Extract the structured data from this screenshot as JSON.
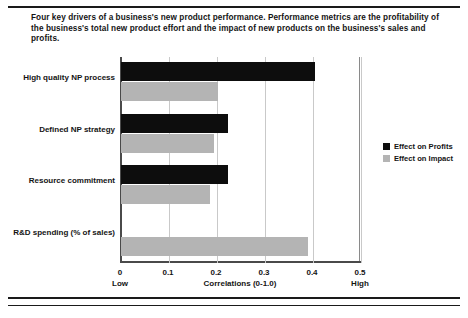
{
  "caption": "Four key drivers of a business's new product performance. Performance metrics are the profitability of the business's total new product effort and the impact of new products on the business's sales and profits.",
  "legend": {
    "position": "right",
    "items": [
      {
        "label": "Effect on Profits",
        "color": "#0d0d0d",
        "swatch_name": "legend-swatch-profits"
      },
      {
        "label": "Effect on Impact",
        "color": "#b4b4b4",
        "swatch_name": "legend-swatch-impact"
      }
    ]
  },
  "axis": {
    "title": "Correlations (0-1.0)",
    "ticks": [
      "0",
      "0.1",
      "0.2",
      "0.3",
      "0.4",
      "0.5"
    ],
    "tick_values": [
      0,
      0.1,
      0.2,
      0.3,
      0.4,
      0.5
    ],
    "low_label": "Low",
    "high_label": "High"
  },
  "chart_data": {
    "type": "bar",
    "orientation": "horizontal",
    "title": "",
    "xlabel": "Correlations (0-1.0)",
    "ylabel": "",
    "xlim": [
      0,
      0.5
    ],
    "xticks": [
      0,
      0.1,
      0.2,
      0.3,
      0.4,
      0.5
    ],
    "grid": true,
    "legend_position": "right",
    "categories": [
      "High quality NP process",
      "Defined NP strategy",
      "Resource commitment",
      "R&D spending (% of sales)"
    ],
    "series": [
      {
        "name": "Effect on Profits",
        "color": "#0d0d0d",
        "values": [
          0.405,
          0.222,
          0.222,
          null
        ]
      },
      {
        "name": "Effect on Impact",
        "color": "#b4b4b4",
        "values": [
          0.202,
          0.194,
          0.185,
          0.39
        ]
      }
    ],
    "annotations": [
      "Low",
      "High"
    ]
  }
}
